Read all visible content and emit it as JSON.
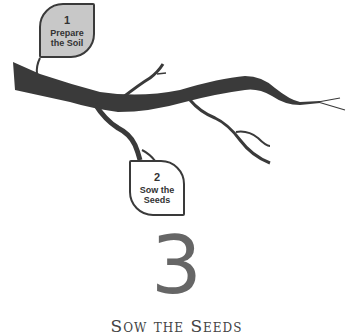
{
  "steps": [
    {
      "number": "1",
      "label_line1": "Prepare",
      "label_line2": "the Soil",
      "fill": "#c8c8c8"
    },
    {
      "number": "2",
      "label_line1": "Sow the",
      "label_line2": "Seeds",
      "fill": "#ffffff"
    }
  ],
  "current_step": {
    "number": "3",
    "title": "Sow the Seeds"
  },
  "colors": {
    "branch": "#3a3a3a",
    "leaf_active": "#c8c8c8",
    "big_number": "#666666"
  }
}
